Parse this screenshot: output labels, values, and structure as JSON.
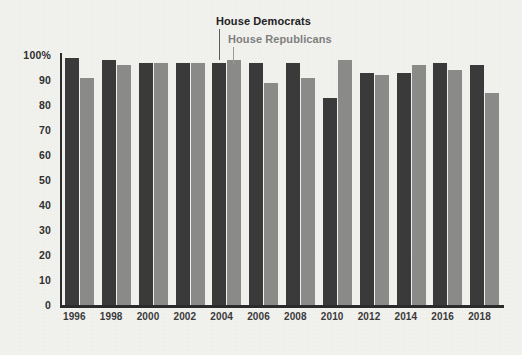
{
  "chart_data": {
    "type": "bar",
    "title": "",
    "subtitle": "",
    "xlabel": "",
    "ylabel": "",
    "ylim": [
      0,
      100
    ],
    "y_ticks": [
      "100%",
      "90",
      "80",
      "70",
      "60",
      "50",
      "40",
      "30",
      "20",
      "10",
      "0"
    ],
    "y_tick_values": [
      100,
      90,
      80,
      70,
      60,
      50,
      40,
      30,
      20,
      10,
      0
    ],
    "grid": false,
    "legend_position": "inside-top-center",
    "categories": [
      "1996",
      "1998",
      "2000",
      "2002",
      "2004",
      "2006",
      "2008",
      "2010",
      "2012",
      "2014",
      "2016",
      "2018"
    ],
    "series": [
      {
        "name": "House Democrats",
        "color": "#3a3a3a",
        "values": [
          99,
          98,
          97,
          97,
          97,
          97,
          97,
          83,
          93,
          93,
          97,
          96
        ]
      },
      {
        "name": "House Republicans",
        "color": "#8a8a88",
        "values": [
          91,
          96,
          97,
          97,
          98,
          89,
          91,
          98,
          92,
          96,
          94,
          85
        ]
      }
    ],
    "annotations": [
      {
        "name": "House Democrats",
        "points_to": "2004-democrat-bar"
      },
      {
        "name": "House Republicans",
        "points_to": "2004-republican-bar"
      }
    ]
  },
  "legend": {
    "democrats": "House Democrats",
    "republicans": "House Republicans"
  },
  "colors": {
    "background": "#f1f1ee",
    "axis": "#2b2b2b",
    "democrat": "#3a3a3a",
    "republican": "#8a8a88",
    "text": "#2f2f2f"
  }
}
